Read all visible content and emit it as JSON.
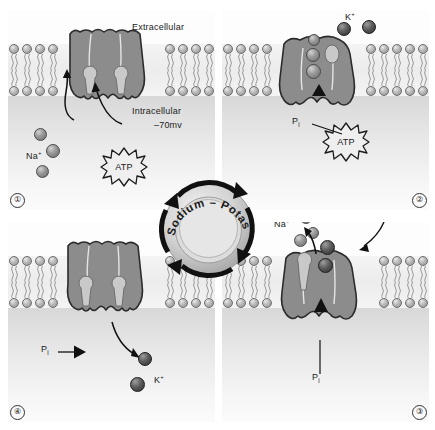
{
  "figure": {
    "title": "Sodium – Potassium Pump",
    "hub_label": "Sodium – Potassium Pump",
    "compartments": {
      "extracellular": "Extracellular",
      "intracellular": "Intracellular",
      "membrane_potential": "–70mv"
    },
    "ion_labels": {
      "sodium": "Na",
      "sodium_charge": "+",
      "potassium": "K",
      "potassium_charge": "+"
    },
    "energy_label": "ATP",
    "phosphate_label": "P",
    "phosphate_sub": "i"
  },
  "panels": [
    {
      "number": "①",
      "id": "panel-1",
      "caption": "Three sodium ions bind to the pump from the intracellular side; ATP binds.",
      "labels": {
        "extracellular": "Extracellular",
        "intracellular": "Intracellular",
        "potential": "–70mv",
        "ion": "Na",
        "ion_charge": "+",
        "energy": "ATP"
      },
      "ion_count": 3,
      "ion_species": "sodium"
    },
    {
      "number": "②",
      "id": "panel-2",
      "caption": "ATP is hydrolysed; the phosphate group Pi attaches and the pump changes shape.",
      "labels": {
        "ion": "K",
        "ion_charge": "+",
        "energy": "ATP",
        "phosphate": "P",
        "phosphate_sub": "i"
      },
      "bound_sodium": 3,
      "free_potassium": 2
    },
    {
      "number": "③",
      "id": "panel-3",
      "caption": "Sodium ions are released outside the cell and two potassium ions bind.",
      "labels": {
        "ion": "Na",
        "ion_charge": "+",
        "phosphate": "P",
        "phosphate_sub": "i"
      },
      "released_sodium": 3,
      "bound_potassium": 2
    },
    {
      "number": "④",
      "id": "panel-4",
      "caption": "The phosphate is released and potassium ions enter the cell.",
      "labels": {
        "ion": "K",
        "ion_charge": "+",
        "phosphate": "P",
        "phosphate_sub": "i"
      },
      "released_potassium": 2
    }
  ],
  "colors": {
    "protein_fill": "#8c8c8c",
    "protein_stroke": "#2b2b2b",
    "channel_line": "#e4e4e4",
    "sodium_ion": "#8a8a8a",
    "potassium_ion": "#4a4a4a",
    "membrane_head": "#b3b3b3",
    "background": "#ffffff",
    "text": "#222222"
  }
}
